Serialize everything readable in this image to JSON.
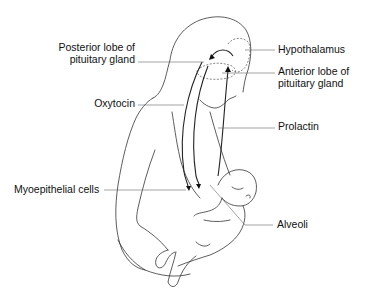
{
  "diagram": {
    "labels": {
      "posterior_lobe_line1": "Posterior lobe of",
      "posterior_lobe_line2": "pituitary gland",
      "oxytocin": "Oxytocin",
      "myoepithelial": "Myoepithelial cells",
      "hypothalamus": "Hypothalamus",
      "anterior_lobe_line1": "Anterior lobe of",
      "anterior_lobe_line2": "pituitary gland",
      "prolactin": "Prolactin",
      "alveoli": "Alveoli"
    },
    "colors": {
      "line": "#222222",
      "text": "#111111",
      "background": "#ffffff"
    }
  }
}
